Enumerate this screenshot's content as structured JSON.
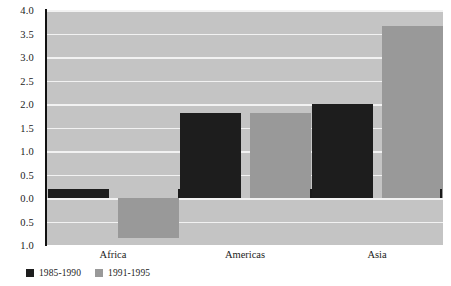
{
  "chart_data": {
    "type": "bar",
    "title": "",
    "subtitle": "",
    "xlabel": "",
    "ylabel": "",
    "categories": [
      "Africa",
      "Americas",
      "Asia"
    ],
    "series": [
      {
        "name": "1985-1990",
        "color": "#1d1d1d",
        "values": [
          0.2,
          1.8,
          2.0
        ]
      },
      {
        "name": "1991-1995",
        "color": "#999999",
        "values": [
          -0.85,
          1.8,
          3.65
        ]
      }
    ],
    "ylim": [
      -1.0,
      4.0
    ],
    "ytick_values": [
      4.0,
      3.5,
      3.0,
      2.5,
      2.0,
      1.5,
      1.0,
      0.5,
      0.0,
      -0.5,
      -1.0
    ],
    "ytick_labels": [
      "4.0",
      "3.5",
      "3.0",
      "2.5",
      "2.0",
      "1.5",
      "1.0",
      "0.5",
      "0.0",
      "0.5",
      "1.0"
    ],
    "grid": true,
    "gridline_color": "#f2f2f2",
    "plot_background": "#c4c4c4",
    "page_background": "#ffffff",
    "legend_position": "bottom-left",
    "zero_line_ticks": true,
    "annotations": []
  }
}
